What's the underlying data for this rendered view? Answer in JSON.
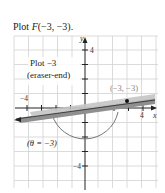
{
  "title": {
    "prefix": "Plot ",
    "func": "F",
    "args": "(−3, −3)."
  },
  "graph": {
    "axis_labels": {
      "x": "x",
      "y": "y"
    },
    "tick_labels": {
      "x_neg": "−4",
      "x_pos": "4",
      "y_pos": "4",
      "y_neg": "−4"
    },
    "annotations": {
      "plot_line1": "Plot −3",
      "plot_line2": "(eraser-end)",
      "point_label": "(−3, −3)",
      "angle_label": "(θ = −3)"
    },
    "colors": {
      "grid": "#cfcfcf",
      "axis": "#222222",
      "pencil_body": "#9a9a9a",
      "pencil_highlight": "#c8c8c8",
      "arc": "#555555",
      "point_label": "#777777"
    }
  }
}
